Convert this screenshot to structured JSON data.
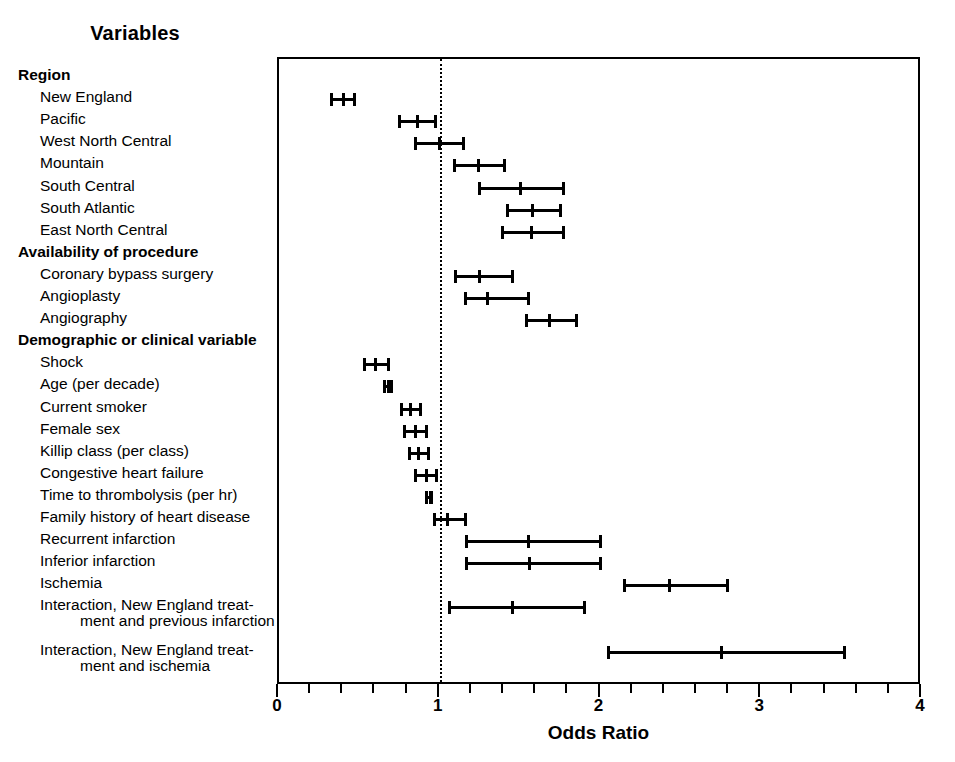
{
  "figure": {
    "variables_header": "Variables",
    "axis_title": "Odds Ratio"
  },
  "axis": {
    "ticks_major": [
      "0",
      "1",
      "2",
      "3",
      "4"
    ],
    "minor_per_major": 5
  },
  "chart_data": {
    "type": "scatter",
    "title": "",
    "xlabel": "Odds Ratio",
    "ylabel": "Variables",
    "xlim": [
      0,
      4
    ],
    "xticks": [
      0,
      1,
      2,
      3,
      4
    ],
    "grid": false,
    "legend": "none",
    "reference_line": 1.0,
    "annotations": [
      "Horizontal bars are odds ratios with 95% confidence intervals; dotted vertical line marks an odds ratio of 1."
    ],
    "rows": [
      {
        "label": "Region",
        "type": "group"
      },
      {
        "label": "New England",
        "type": "item",
        "or": 0.4,
        "low": 0.32,
        "high": 0.48
      },
      {
        "label": "Pacific",
        "type": "item",
        "or": 0.86,
        "low": 0.74,
        "high": 0.98
      },
      {
        "label": "West North Central",
        "type": "item",
        "or": 1.0,
        "low": 0.84,
        "high": 1.16
      },
      {
        "label": "Mountain",
        "type": "item",
        "or": 1.24,
        "low": 1.08,
        "high": 1.41
      },
      {
        "label": "South Central",
        "type": "item",
        "or": 1.5,
        "low": 1.24,
        "high": 1.78
      },
      {
        "label": "South Atlantic",
        "type": "item",
        "or": 1.58,
        "low": 1.41,
        "high": 1.76
      },
      {
        "label": "East North Central",
        "type": "item",
        "or": 1.57,
        "low": 1.38,
        "high": 1.78
      },
      {
        "label": "Availability of procedure",
        "type": "group"
      },
      {
        "label": "Coronary bypass surgery",
        "type": "item",
        "or": 1.25,
        "low": 1.09,
        "high": 1.46
      },
      {
        "label": "Angioplasty",
        "type": "item",
        "or": 1.3,
        "low": 1.15,
        "high": 1.56
      },
      {
        "label": "Angiography",
        "type": "item",
        "or": 1.68,
        "low": 1.53,
        "high": 1.86
      },
      {
        "label": "Demographic or clinical variable",
        "type": "group"
      },
      {
        "label": "Shock",
        "type": "item",
        "or": 0.6,
        "low": 0.52,
        "high": 0.69
      },
      {
        "label": "Age (per decade)",
        "type": "item",
        "or": 0.68,
        "low": 0.65,
        "high": 0.71
      },
      {
        "label": "Current smoker",
        "type": "item",
        "or": 0.82,
        "low": 0.75,
        "high": 0.89
      },
      {
        "label": "Female sex",
        "type": "item",
        "or": 0.85,
        "low": 0.77,
        "high": 0.93
      },
      {
        "label": "Killip class (per class)",
        "type": "item",
        "or": 0.87,
        "low": 0.8,
        "high": 0.94
      },
      {
        "label": "Congestive heart failure",
        "type": "item",
        "or": 0.92,
        "low": 0.84,
        "high": 0.99
      },
      {
        "label": "Time to thrombolysis (per hr)",
        "type": "item",
        "or": 0.94,
        "low": 0.91,
        "high": 0.96
      },
      {
        "label": "Family history of heart disease",
        "type": "item",
        "or": 1.05,
        "low": 0.96,
        "high": 1.17
      },
      {
        "label": "Recurrent infarction",
        "type": "item",
        "or": 1.55,
        "low": 1.16,
        "high": 2.01
      },
      {
        "label": "Inferior infarction",
        "type": "item",
        "or": 1.56,
        "low": 1.16,
        "high": 2.01
      },
      {
        "label": "Ischemia",
        "type": "item",
        "or": 2.43,
        "low": 2.14,
        "high": 2.8
      },
      {
        "label": "Interaction, New England treat-",
        "label_cont": "ment and previous infarction",
        "type": "item",
        "or": 1.45,
        "low": 1.05,
        "high": 1.91
      },
      {
        "label": "Interaction, New England treat-",
        "label_cont": "ment and ischemia",
        "type": "item",
        "or": 2.75,
        "low": 2.04,
        "high": 3.53
      }
    ]
  }
}
